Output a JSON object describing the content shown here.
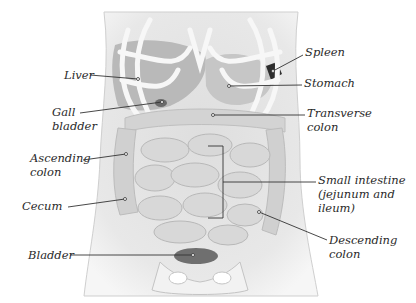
{
  "diagram": {
    "colors": {
      "background": "#ffffff",
      "body": "#e4e4e4",
      "organ": "#cfcfcf",
      "organ_dark": "#a8a8a8",
      "rib": "#f4f4f4",
      "spleen": "#2e2e2e",
      "leader": "#333333",
      "text": "#2a2a2a"
    },
    "labels": [
      {
        "id": "liver",
        "text": "Liver",
        "x": 64,
        "y": 68,
        "align": "left",
        "point": [
          138,
          79
        ],
        "start": [
          90,
          75
        ]
      },
      {
        "id": "gall-bladder",
        "text": "Gall\nbladder",
        "x": 52,
        "y": 105,
        "align": "left",
        "point": [
          162,
          102
        ],
        "start": [
          80,
          113
        ]
      },
      {
        "id": "spleen",
        "text": "Spleen",
        "x": 305,
        "y": 45,
        "align": "left",
        "point": [
          273,
          71
        ],
        "start": [
          303,
          55
        ]
      },
      {
        "id": "stomach",
        "text": "Stomach",
        "x": 304,
        "y": 73,
        "align": "left",
        "point": [
          229,
          86
        ],
        "start": [
          302,
          85
        ]
      },
      {
        "id": "transverse-colon",
        "text": "Transverse\ncolon",
        "x": 307,
        "y": 103,
        "align": "left",
        "point": [
          213,
          115
        ],
        "start": [
          305,
          115
        ]
      },
      {
        "id": "ascending-colon",
        "text": "Ascending\ncolon",
        "x": 30,
        "y": 148,
        "align": "left",
        "point": [
          126,
          154
        ],
        "start": [
          83,
          160
        ]
      },
      {
        "id": "cecum",
        "text": "Cecum",
        "x": 22,
        "y": 197,
        "align": "left",
        "point": [
          125,
          199
        ],
        "start": [
          68,
          207
        ]
      },
      {
        "id": "small-intestine",
        "text": "Small intestine\n(jejunum and\nileum)",
        "x": 318,
        "y": 172,
        "align": "left",
        "point": [
          223,
          182
        ],
        "start": [
          316,
          182
        ]
      },
      {
        "id": "descending-colon",
        "text": "Descending\ncolon",
        "x": 329,
        "y": 234,
        "align": "left",
        "point": [
          259,
          212
        ],
        "start": [
          327,
          240
        ]
      },
      {
        "id": "bladder",
        "text": "Bladder",
        "x": 28,
        "y": 246,
        "align": "left",
        "point": [
          193,
          255
        ],
        "start": [
          70,
          255
        ]
      }
    ],
    "bracket": {
      "x": 223,
      "top": 146,
      "bottom": 218,
      "left": 208
    }
  }
}
